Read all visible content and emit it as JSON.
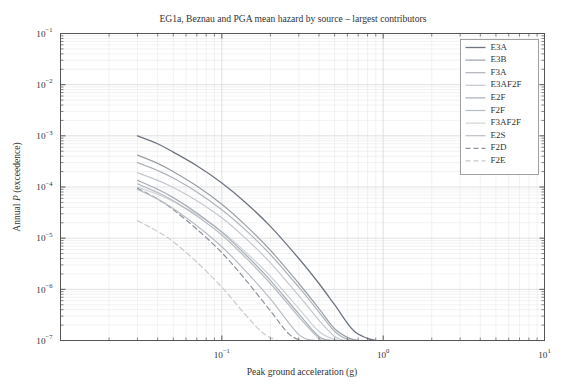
{
  "figure": {
    "width": 569,
    "height": 391,
    "background": "#ffffff"
  },
  "chart_data": {
    "type": "line",
    "title": "EG1a, Beznau and PGA mean hazard by source – largest contributors",
    "xlabel": "Peak ground acceleration (g)",
    "ylabel": "Annual P (exceedence)",
    "xscale": "log",
    "yscale": "log",
    "xlim": [
      0.01,
      10
    ],
    "ylim": [
      1e-07,
      0.1
    ],
    "grid": true,
    "grid_minor": true,
    "legend_position": "upper right",
    "xticks": [
      0.01,
      0.1,
      1,
      10
    ],
    "xtick_labels": [
      "",
      "10⁻¹",
      "10⁰",
      "10¹"
    ],
    "yticks": [
      0.1,
      0.01,
      0.001,
      0.0001,
      1e-05,
      1e-06,
      1e-07
    ],
    "ytick_labels": [
      "10⁻¹",
      "10⁻²",
      "10⁻³",
      "10⁻⁴",
      "10⁻⁵",
      "10⁻⁶",
      "10⁻⁷"
    ],
    "series": [
      {
        "name": "E3A",
        "color": "#6e7580",
        "style": "solid",
        "width": 1.3,
        "x": [
          0.03,
          0.04,
          0.05,
          0.07,
          0.1,
          0.14,
          0.2,
          0.3,
          0.4,
          0.5,
          0.65,
          0.8,
          0.9
        ],
        "y": [
          0.001,
          0.0007,
          0.00048,
          0.00026,
          0.00012,
          5e-05,
          1.7e-05,
          4e-06,
          1.3e-06,
          5e-07,
          1.6e-07,
          1.1e-07,
          1e-07
        ]
      },
      {
        "name": "E3B",
        "color": "#9aa0a8",
        "style": "solid",
        "width": 1.2,
        "x": [
          0.03,
          0.04,
          0.05,
          0.07,
          0.1,
          0.14,
          0.2,
          0.3,
          0.4,
          0.5,
          0.62,
          0.72
        ],
        "y": [
          0.00042,
          0.00029,
          0.0002,
          0.000105,
          4.6e-05,
          1.8e-05,
          5.8e-06,
          1.3e-06,
          4.2e-07,
          1.7e-07,
          1.1e-07,
          1e-07
        ]
      },
      {
        "name": "F3A",
        "color": "#b0b5bc",
        "style": "solid",
        "width": 1.2,
        "x": [
          0.03,
          0.04,
          0.05,
          0.07,
          0.1,
          0.14,
          0.2,
          0.3,
          0.4,
          0.5,
          0.6,
          0.68
        ],
        "y": [
          0.0003,
          0.00021,
          0.00015,
          8e-05,
          3.6e-05,
          1.45e-05,
          4.8e-06,
          1.1e-06,
          3.6e-07,
          1.5e-07,
          1.05e-07,
          1e-07
        ]
      },
      {
        "name": "E3AF2F",
        "color": "#c4c8ce",
        "style": "solid",
        "width": 1.2,
        "x": [
          0.03,
          0.04,
          0.05,
          0.07,
          0.1,
          0.14,
          0.2,
          0.3,
          0.4,
          0.5,
          0.58
        ],
        "y": [
          0.00019,
          0.000135,
          9.8e-05,
          5.4e-05,
          2.5e-05,
          1e-05,
          3.3e-06,
          7.5e-07,
          2.5e-07,
          1.2e-07,
          1e-07
        ]
      },
      {
        "name": "E2F",
        "color": "#a8aeb6",
        "style": "solid",
        "width": 1.2,
        "x": [
          0.03,
          0.04,
          0.05,
          0.07,
          0.1,
          0.14,
          0.2,
          0.3,
          0.4,
          0.48
        ],
        "y": [
          0.000135,
          9e-05,
          6.2e-05,
          3.1e-05,
          1.3e-05,
          4.8e-06,
          1.5e-06,
          3.3e-07,
          1.2e-07,
          1e-07
        ]
      },
      {
        "name": "F2F",
        "color": "#b8bcc2",
        "style": "solid",
        "width": 1.2,
        "x": [
          0.03,
          0.04,
          0.05,
          0.07,
          0.1,
          0.14,
          0.2,
          0.3,
          0.4,
          0.45
        ],
        "y": [
          0.000115,
          7.8e-05,
          5.4e-05,
          2.7e-05,
          1.15e-05,
          4.2e-06,
          1.3e-06,
          2.9e-07,
          1.1e-07,
          1e-07
        ]
      },
      {
        "name": "F3AF2F",
        "color": "#cfd2d6",
        "style": "solid",
        "width": 1.2,
        "x": [
          0.03,
          0.04,
          0.05,
          0.07,
          0.1,
          0.14,
          0.2,
          0.3,
          0.4,
          0.5,
          0.56
        ],
        "y": [
          0.0001,
          7.2e-05,
          5.2e-05,
          2.9e-05,
          1.35e-05,
          5.4e-06,
          1.8e-06,
          4.2e-07,
          1.5e-07,
          1.05e-07,
          1e-07
        ]
      },
      {
        "name": "E2S",
        "color": "#babec4",
        "style": "solid",
        "width": 1.2,
        "x": [
          0.03,
          0.04,
          0.05,
          0.07,
          0.1,
          0.14,
          0.2,
          0.3,
          0.38
        ],
        "y": [
          9e-05,
          5.8e-05,
          3.8e-05,
          1.75e-05,
          6.8e-06,
          2.3e-06,
          6.5e-07,
          1.3e-07,
          1e-07
        ]
      },
      {
        "name": "F2D",
        "color": "#8e949c",
        "style": "dashed",
        "width": 1.2,
        "x": [
          0.03,
          0.04,
          0.05,
          0.07,
          0.1,
          0.14,
          0.2,
          0.26,
          0.31
        ],
        "y": [
          9.5e-05,
          5.8e-05,
          3.6e-05,
          1.5e-05,
          5.2e-06,
          1.55e-06,
          3.8e-07,
          1.35e-07,
          1e-07
        ]
      },
      {
        "name": "F2E",
        "color": "#c8ccd1",
        "style": "dashed",
        "width": 1.2,
        "x": [
          0.03,
          0.04,
          0.05,
          0.07,
          0.1,
          0.14,
          0.18,
          0.22
        ],
        "y": [
          2.2e-05,
          1.35e-05,
          8.5e-06,
          3.4e-06,
          1.1e-06,
          3.2e-07,
          1.4e-07,
          1e-07
        ]
      }
    ]
  },
  "legend": {
    "items": [
      "E3A",
      "E3B",
      "F3A",
      "E3AF2F",
      "E2F",
      "F2F",
      "F3AF2F",
      "E2S",
      "F2D",
      "F2E"
    ]
  },
  "colors": {
    "axis": "#555555",
    "grid_major": "#d8d8d8",
    "grid_minor": "#eaeaea",
    "text": "#333333",
    "legend_border": "#8a8a8a"
  }
}
